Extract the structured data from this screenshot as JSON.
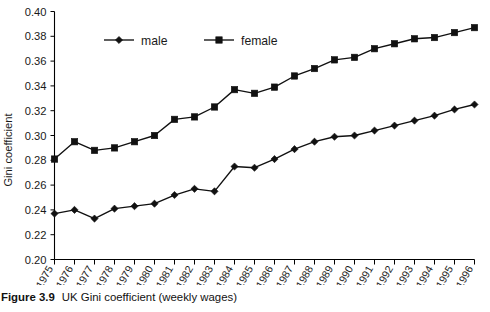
{
  "figure": {
    "caption_label": "Figure 3.9",
    "caption_text": "UK Gini coefficient (weekly wages)"
  },
  "chart_data": {
    "type": "line",
    "title": "",
    "xlabel": "",
    "ylabel": "Gini coefficient",
    "xlim": [
      1975,
      1996
    ],
    "ylim": [
      0.2,
      0.4
    ],
    "ytick_step": 0.02,
    "grid": false,
    "legend_position": "top-center",
    "x": [
      1975,
      1976,
      1977,
      1978,
      1979,
      1980,
      1981,
      1982,
      1983,
      1984,
      1985,
      1986,
      1987,
      1988,
      1989,
      1990,
      1991,
      1992,
      1993,
      1994,
      1995,
      1996
    ],
    "xtick_labels": [
      "1975",
      "1976",
      "1977",
      "1978",
      "1979",
      "1980",
      "1981",
      "1982",
      "1983",
      "1984",
      "1985",
      "1986",
      "1987",
      "1988",
      "1989",
      "1990",
      "1991",
      "1992",
      "1993",
      "1994",
      "1995",
      "1996"
    ],
    "ytick_labels": [
      "0.20",
      "0.22",
      "0.24",
      "0.26",
      "0.28",
      "0.30",
      "0.32",
      "0.34",
      "0.36",
      "0.38",
      "0.40"
    ],
    "ytick_values": [
      0.2,
      0.22,
      0.24,
      0.26,
      0.28,
      0.3,
      0.32,
      0.34,
      0.36,
      0.38,
      0.4
    ],
    "series": [
      {
        "name": "male",
        "marker": "diamond",
        "color": "#111111",
        "values": [
          0.237,
          0.24,
          0.233,
          0.241,
          0.243,
          0.245,
          0.252,
          0.257,
          0.255,
          0.275,
          0.274,
          0.281,
          0.289,
          0.295,
          0.299,
          0.3,
          0.304,
          0.308,
          0.312,
          0.316,
          0.321,
          0.325
        ]
      },
      {
        "name": "female",
        "marker": "square",
        "color": "#111111",
        "values": [
          0.281,
          0.295,
          0.288,
          0.29,
          0.295,
          0.3,
          0.313,
          0.315,
          0.323,
          0.337,
          0.334,
          0.339,
          0.348,
          0.354,
          0.361,
          0.363,
          0.37,
          0.374,
          0.378,
          0.379,
          0.383,
          0.387
        ]
      }
    ]
  }
}
